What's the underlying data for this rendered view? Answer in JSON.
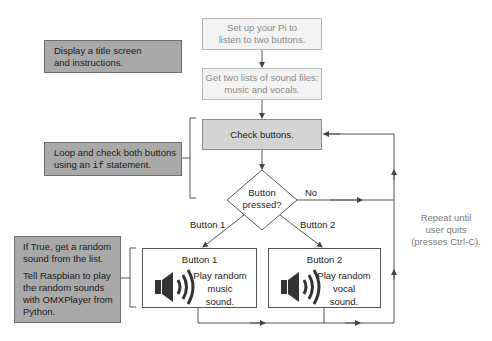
{
  "flow": {
    "step_setup": [
      "Set up your Pi to",
      "listen to two buttons."
    ],
    "step_lists": [
      "Get two lists of sound files:",
      "music and vocals."
    ],
    "step_check": "Check buttons.",
    "decision": [
      "Button",
      "pressed?"
    ],
    "no_label": "No",
    "branch1_label": "Button 1",
    "branch2_label": "Button 2",
    "repeat_note": [
      "Repeat until",
      "user quits",
      "(presses Ctrl-C)."
    ]
  },
  "actions": [
    {
      "title": "Button 1",
      "desc": [
        "Play random",
        "music",
        "sound."
      ],
      "icon": "speaker-icon"
    },
    {
      "title": "Button 2",
      "desc": [
        "Play random",
        "vocal",
        "sound."
      ],
      "icon": "speaker-icon"
    }
  ],
  "notes": {
    "title_screen": [
      "Display a title screen",
      "and instructions."
    ],
    "loop": {
      "pre": "Loop and check both buttons",
      "line2_a": "using an ",
      "code": "if",
      "line2_b": " statement."
    },
    "play": {
      "p1": [
        "If True, get a random",
        "sound from the list."
      ],
      "p2": [
        "Tell Raspbian to play",
        "the random sounds",
        "with OMXPlayer from",
        "Python."
      ]
    }
  },
  "colors": {
    "line": "#555555",
    "note_bg": "#a9a9a9",
    "mid_bg": "#d4d4d4",
    "light_bg": "#f3f3f3"
  }
}
